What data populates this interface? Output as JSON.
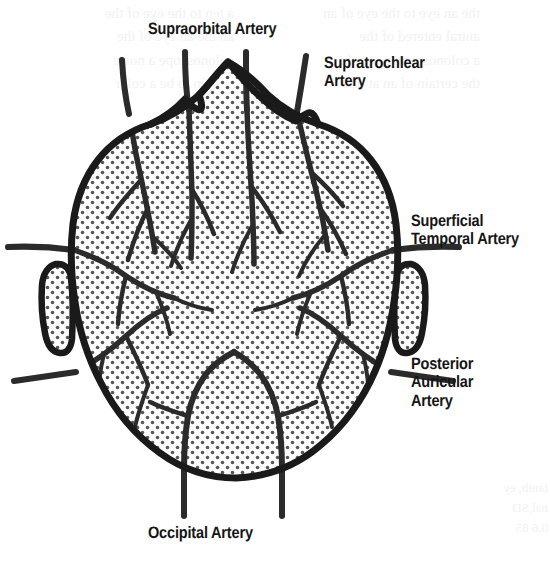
{
  "figure": {
    "background_color": "#ffffff",
    "ink_color": "#1a1a1a",
    "stipple_color": "#555555"
  },
  "labels": {
    "supraorbital": "Supraorbital Artery",
    "supratrochlear": "Supratrochlear\nArtery",
    "superficial_temporal": "Superficial\nTemporal Artery",
    "posterior_auricular": "Posterior\nAuricular\nArtery",
    "occipital": "Occipital Artery"
  },
  "bleed_through": {
    "top_left": "a ten to the eye of the\nan the an eye of the\ncolonoscope a noise\ncertain to be a color",
    "top_right": "the an eye to the eye of an\nantral entered of the\na colonoscope a certain\nthe certain of an at one",
    "bottom_right": "tanth, ey\nnal,SD\n0.6 85"
  }
}
